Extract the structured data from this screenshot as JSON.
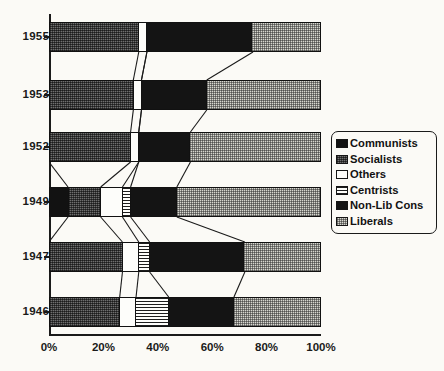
{
  "chart_data": {
    "type": "bar",
    "subtype": "100% stacked horizontal bar",
    "title": "",
    "xlabel": "",
    "ylabel": "",
    "xlim": [
      0,
      100
    ],
    "grid": false,
    "legend_position": "right",
    "categories": [
      "1955",
      "1953",
      "1952",
      "1949",
      "1947",
      "1946"
    ],
    "xtick_labels": [
      "0%",
      "20%",
      "40%",
      "60%",
      "80%",
      "100%"
    ],
    "xtick_values": [
      0,
      20,
      40,
      60,
      80,
      100
    ],
    "series": [
      {
        "name": "Communists",
        "pattern": "solid-black",
        "values": [
          0,
          0,
          0,
          7,
          0,
          0
        ]
      },
      {
        "name": "Socialists",
        "pattern": "dark-gray-dither",
        "values": [
          33,
          31,
          30,
          12,
          27,
          26
        ]
      },
      {
        "name": "Others",
        "pattern": "white",
        "values": [
          3,
          3,
          3,
          8,
          6,
          6
        ]
      },
      {
        "name": "Centrists",
        "pattern": "horizontal-stripes",
        "values": [
          0,
          0,
          0,
          3,
          4,
          12
        ]
      },
      {
        "name": "Non-Lib Cons",
        "pattern": "solid-black",
        "values": [
          39,
          24,
          19,
          17,
          35,
          24
        ]
      },
      {
        "name": "Liberals",
        "pattern": "light-gray-checker",
        "values": [
          25,
          42,
          48,
          53,
          28,
          32
        ]
      }
    ]
  },
  "legend": {
    "items": [
      {
        "label": "Communists",
        "swatch": "swatch-communists"
      },
      {
        "label": "Socialists",
        "swatch": "swatch-socialists"
      },
      {
        "label": "Others",
        "swatch": "swatch-others"
      },
      {
        "label": "Centrists",
        "swatch": "swatch-centrists"
      },
      {
        "label": "Non-Lib Cons",
        "swatch": "swatch-non-lib-cons"
      },
      {
        "label": "Liberals",
        "swatch": "swatch-liberals"
      }
    ]
  },
  "colors": {
    "communists": "#121212",
    "socialists": "#6f6f6f",
    "others": "#fdfdfa",
    "centrists": "#fdfdfa",
    "non_lib_cons": "#141414",
    "liberals": "#d7d7cf",
    "axis": "#1a1a1a",
    "background": "#fbfaf6"
  }
}
